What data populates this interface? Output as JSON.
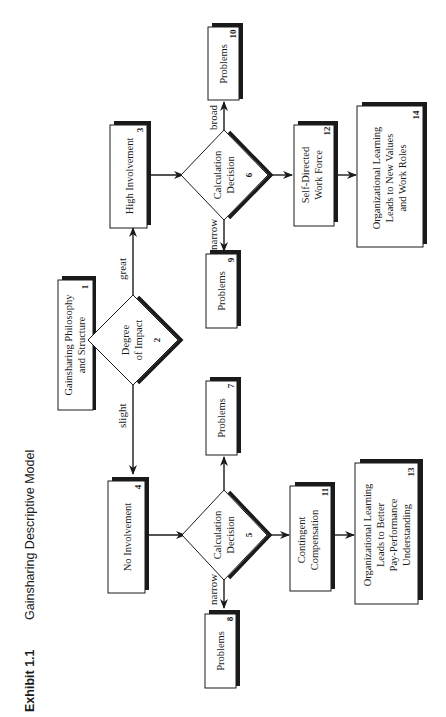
{
  "caption": {
    "exhibit": "Exhibit 1.1",
    "title": "Gainsharing Descriptive Model"
  },
  "nodes": {
    "n1": {
      "id": "1",
      "lines": [
        "Gainsharing Philosophy",
        "and Structure"
      ],
      "shape": "box"
    },
    "n2": {
      "id": "2",
      "lines": [
        "Degree",
        "of Impact"
      ],
      "shape": "diamond"
    },
    "n3": {
      "id": "3",
      "lines": [
        "High Involvement"
      ],
      "shape": "box"
    },
    "n4": {
      "id": "4",
      "lines": [
        "No Involvement"
      ],
      "shape": "box"
    },
    "n5": {
      "id": "5",
      "lines": [
        "Calculation",
        "Decision"
      ],
      "shape": "diamond"
    },
    "n6": {
      "id": "6",
      "lines": [
        "Calculation",
        "Decision"
      ],
      "shape": "diamond"
    },
    "n7": {
      "id": "7",
      "lines": [
        "Problems"
      ],
      "shape": "box"
    },
    "n8": {
      "id": "8",
      "lines": [
        "Problems"
      ],
      "shape": "box"
    },
    "n9": {
      "id": "9",
      "lines": [
        "Problems"
      ],
      "shape": "box"
    },
    "n10": {
      "id": "10",
      "lines": [
        "Problems"
      ],
      "shape": "box"
    },
    "n11": {
      "id": "11",
      "lines": [
        "Contingent",
        "Compensation"
      ],
      "shape": "box"
    },
    "n12": {
      "id": "12",
      "lines": [
        "Self-Directed",
        "Work Force"
      ],
      "shape": "box"
    },
    "n13": {
      "id": "13",
      "lines": [
        "Organizational Learning",
        "Leads to Better",
        "Pay-Performance",
        "Understanding"
      ],
      "shape": "box"
    },
    "n14": {
      "id": "14",
      "lines": [
        "Organizational Learning",
        "Leads to New Values",
        "and Work Roles"
      ],
      "shape": "box"
    }
  },
  "edges": [
    {
      "from": "1",
      "to": "2",
      "label": ""
    },
    {
      "from": "2",
      "to": "3",
      "label": "great"
    },
    {
      "from": "2",
      "to": "4",
      "label": "slight"
    },
    {
      "from": "3",
      "to": "6",
      "label": ""
    },
    {
      "from": "6",
      "to": "10",
      "label": "broad"
    },
    {
      "from": "6",
      "to": "9",
      "label": "narrow"
    },
    {
      "from": "6",
      "to": "12",
      "label": ""
    },
    {
      "from": "12",
      "to": "14",
      "label": ""
    },
    {
      "from": "4",
      "to": "5",
      "label": ""
    },
    {
      "from": "5",
      "to": "7",
      "label": "narrow"
    },
    {
      "from": "5",
      "to": "8",
      "label": "broad"
    },
    {
      "from": "5",
      "to": "11",
      "label": ""
    },
    {
      "from": "11",
      "to": "13",
      "label": ""
    }
  ],
  "colors": {
    "ink": "#1a1a1a",
    "background": "#ffffff"
  }
}
